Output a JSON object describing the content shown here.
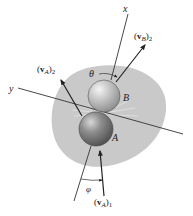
{
  "diagram": {
    "type": "oblique-impact-collision",
    "bodies": [
      {
        "id": "A",
        "label": "A"
      },
      {
        "id": "B",
        "label": "B"
      }
    ],
    "axes": {
      "x_label": "x",
      "y_label": "y"
    },
    "vectors": {
      "vB2": {
        "sym": "v",
        "sub": "B",
        "post": "2"
      },
      "vA2": {
        "sym": "v",
        "sub": "A",
        "post": "2"
      },
      "vA1": {
        "sym": "v",
        "sub": "A",
        "post": "1"
      }
    },
    "angles": {
      "theta": "θ",
      "phi": "φ"
    },
    "colors": {
      "background_blob": "#c8c8c8",
      "sphere_A": "#8a8a8a",
      "sphere_B": "#b9b9b9",
      "line": "#333333"
    }
  }
}
